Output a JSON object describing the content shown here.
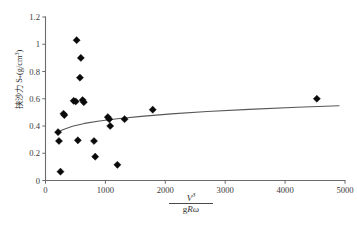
{
  "chart_data": {
    "type": "scatter",
    "title": "",
    "xlabel": "V³/(gRω)",
    "ylabel": "挟沙力 S*(g/cm³)",
    "xlim": [
      0,
      5000
    ],
    "ylim": [
      0,
      1.2
    ],
    "xticks": [
      0,
      1000,
      2000,
      3000,
      4000,
      5000
    ],
    "yticks": [
      0,
      0.2,
      0.4,
      0.6,
      0.8,
      1,
      1.2
    ],
    "xtick_labels": [
      "0",
      "1000",
      "2000",
      "3000",
      "4000",
      "5000"
    ],
    "ytick_labels": [
      "0",
      "0.2",
      "0.4",
      "0.6",
      "0.8",
      "1",
      "1.2"
    ],
    "grid": false,
    "legend": null,
    "marker_style": "filled-diamond",
    "marker_color": "#0a0a0a",
    "line_color": "#575757",
    "points": [
      {
        "x": 210,
        "y": 0.355
      },
      {
        "x": 225,
        "y": 0.29
      },
      {
        "x": 250,
        "y": 0.065
      },
      {
        "x": 300,
        "y": 0.49
      },
      {
        "x": 315,
        "y": 0.48
      },
      {
        "x": 470,
        "y": 0.585
      },
      {
        "x": 505,
        "y": 0.58
      },
      {
        "x": 520,
        "y": 1.03
      },
      {
        "x": 540,
        "y": 0.295
      },
      {
        "x": 575,
        "y": 0.755
      },
      {
        "x": 590,
        "y": 0.9
      },
      {
        "x": 620,
        "y": 0.59
      },
      {
        "x": 640,
        "y": 0.575
      },
      {
        "x": 810,
        "y": 0.29
      },
      {
        "x": 830,
        "y": 0.175
      },
      {
        "x": 1040,
        "y": 0.465
      },
      {
        "x": 1065,
        "y": 0.45
      },
      {
        "x": 1080,
        "y": 0.4
      },
      {
        "x": 1200,
        "y": 0.115
      },
      {
        "x": 1320,
        "y": 0.45
      },
      {
        "x": 1790,
        "y": 0.52
      },
      {
        "x": 4530,
        "y": 0.6
      }
    ],
    "fit_curve": {
      "label": "",
      "x": [
        180,
        300,
        450,
        650,
        900,
        1200,
        1600,
        2100,
        2700,
        3400,
        4200,
        4900
      ],
      "y": [
        0.352,
        0.375,
        0.398,
        0.419,
        0.437,
        0.453,
        0.471,
        0.489,
        0.506,
        0.522,
        0.538,
        0.549
      ]
    }
  },
  "labels": {
    "y_axis_main": "挟沙力 S",
    "y_axis_sub": "*",
    "y_axis_unit_open": "(g/cm",
    "y_axis_unit_sup": "3",
    "y_axis_unit_close": ")",
    "x_numerator": "V",
    "x_numerator_sup": "3",
    "x_den_g": "g",
    "x_den_R": "R",
    "x_den_omega": "ω"
  }
}
